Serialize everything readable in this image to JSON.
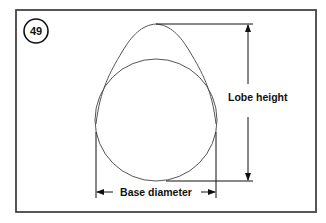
{
  "figure": {
    "number": "49",
    "labels": {
      "lobe_height": "Lobe height",
      "base_diameter": "Base diameter"
    },
    "colors": {
      "line": "#555555",
      "frame": "#444444",
      "text": "#111111",
      "background": "#ffffff"
    }
  }
}
